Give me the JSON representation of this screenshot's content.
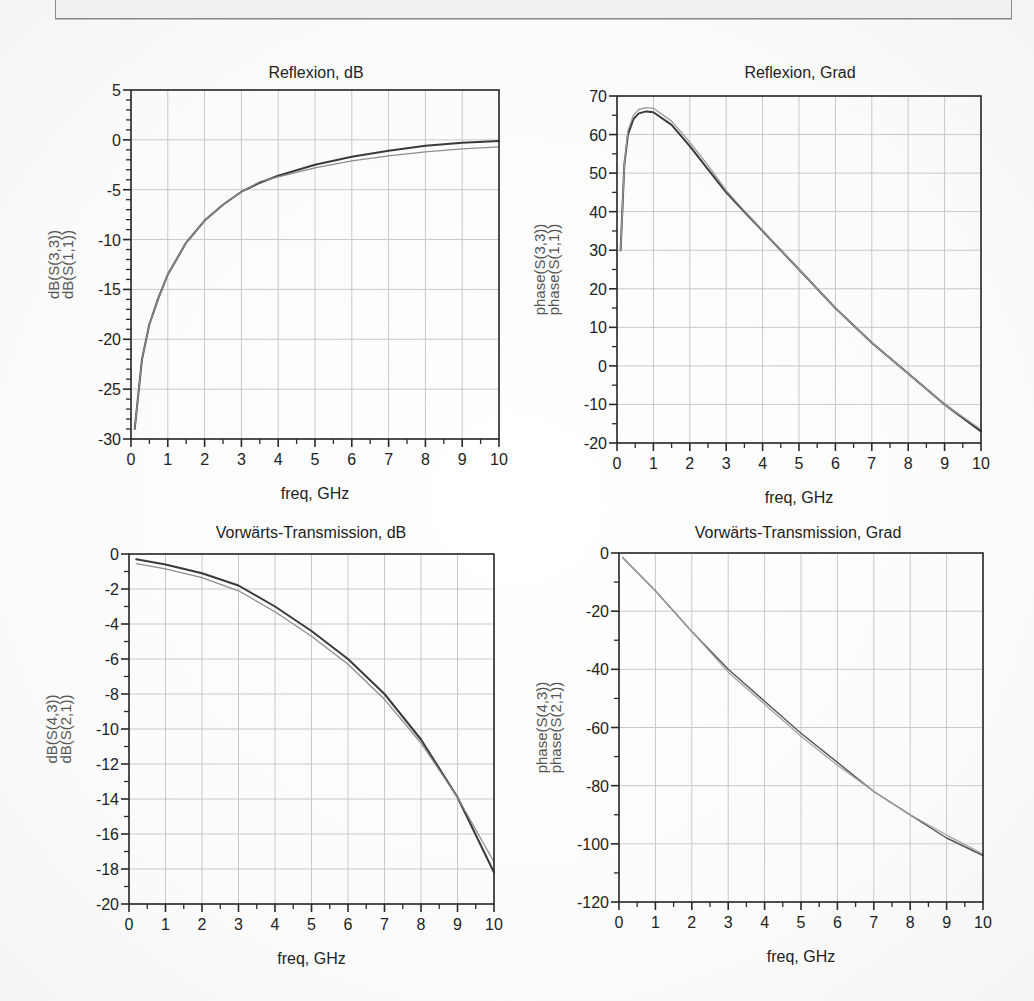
{
  "banner": {
    "text": ""
  },
  "chart_data": [
    {
      "id": "reflexion-db",
      "type": "line",
      "title": "Reflexion, dB",
      "xlabel": "freq, GHz",
      "ylabel_lines": [
        "dB(S(3,3))",
        "dB(S(1,1))"
      ],
      "xlim": [
        0,
        10
      ],
      "ylim": [
        -30,
        5
      ],
      "xticks": [
        0,
        1,
        2,
        3,
        4,
        5,
        6,
        7,
        8,
        9,
        10
      ],
      "yticks": [
        5,
        0,
        -5,
        -10,
        -15,
        -20,
        -25,
        -30
      ],
      "ytick_labels": [
        "5",
        "0",
        "-5",
        "-10",
        "-15",
        "-20",
        "-25",
        "-30"
      ],
      "minor_y_per_major": 5,
      "grid": true,
      "frame": {
        "x0": 131,
        "y0": 90,
        "x1": 499,
        "y1": 439
      },
      "title_pos": [
        316,
        78
      ],
      "series": [
        {
          "name": "dB(S(3,3))",
          "color": "#3a3a3a",
          "width": 2.0,
          "x": [
            0.1,
            0.3,
            0.5,
            0.75,
            1,
            1.5,
            2,
            2.5,
            3,
            3.5,
            4,
            5,
            6,
            7,
            8,
            9,
            10
          ],
          "values": [
            -29,
            -22,
            -18.5,
            -15.8,
            -13.5,
            -10.3,
            -8.1,
            -6.5,
            -5.2,
            -4.3,
            -3.6,
            -2.5,
            -1.7,
            -1.1,
            -0.6,
            -0.3,
            -0.1
          ]
        },
        {
          "name": "dB(S(1,1))",
          "color": "#8c8c8c",
          "width": 1.3,
          "x": [
            0.1,
            0.3,
            0.5,
            0.75,
            1,
            1.5,
            2,
            2.5,
            3,
            3.5,
            4,
            5,
            6,
            7,
            8,
            9,
            10
          ],
          "values": [
            -29,
            -22,
            -18.5,
            -15.8,
            -13.5,
            -10.3,
            -8.1,
            -6.5,
            -5.2,
            -4.2,
            -3.7,
            -2.8,
            -2.1,
            -1.6,
            -1.2,
            -0.9,
            -0.7
          ]
        }
      ]
    },
    {
      "id": "reflexion-grad",
      "type": "line",
      "title": "Reflexion, Grad",
      "xlabel": "freq, GHz",
      "ylabel_lines": [
        "phase(S(3,3))",
        "phase(S(1,1))"
      ],
      "xlim": [
        0,
        10
      ],
      "ylim": [
        -20,
        70
      ],
      "xticks": [
        0,
        1,
        2,
        3,
        4,
        5,
        6,
        7,
        8,
        9,
        10
      ],
      "yticks": [
        70,
        60,
        50,
        40,
        30,
        20,
        10,
        0,
        -10,
        -20
      ],
      "ytick_labels": [
        "70",
        "60",
        "50",
        "40",
        "30",
        "20",
        "10",
        "0",
        "-10",
        "-20"
      ],
      "minor_y_per_major": 2,
      "grid": true,
      "frame": {
        "x0": 617,
        "y0": 96,
        "x1": 981,
        "y1": 443
      },
      "title_pos": [
        800,
        78
      ],
      "series": [
        {
          "name": "phase(S(3,3))",
          "color": "#3a3a3a",
          "width": 2.0,
          "x": [
            0.1,
            0.2,
            0.3,
            0.45,
            0.6,
            0.8,
            1,
            1.5,
            2,
            2.5,
            3,
            3.5,
            4,
            5,
            6,
            7,
            8,
            9,
            10
          ],
          "values": [
            30,
            52,
            60,
            64,
            65.5,
            66,
            65.8,
            62.5,
            57,
            51,
            45,
            40,
            35,
            25,
            15,
            6,
            -2,
            -10,
            -17
          ]
        },
        {
          "name": "phase(S(1,1))",
          "color": "#9a9a9a",
          "width": 1.3,
          "x": [
            0.1,
            0.2,
            0.3,
            0.45,
            0.6,
            0.8,
            1,
            1.5,
            2,
            2.5,
            3,
            3.5,
            4,
            5,
            6,
            7,
            8,
            9,
            10
          ],
          "values": [
            30,
            52,
            61,
            65,
            66.5,
            67,
            66.8,
            63.5,
            58,
            52,
            45.5,
            40.2,
            35.2,
            25,
            15,
            6,
            -2,
            -10,
            -16.5
          ]
        }
      ]
    },
    {
      "id": "transmission-db",
      "type": "line",
      "title": "Vorwärts-Transmission, dB",
      "xlabel": "freq, GHz",
      "ylabel_lines": [
        "dB(S(4,3))",
        "dB(S(2,1))"
      ],
      "xlim": [
        0,
        10
      ],
      "ylim": [
        -20,
        0
      ],
      "xticks": [
        0,
        1,
        2,
        3,
        4,
        5,
        6,
        7,
        8,
        9,
        10
      ],
      "yticks": [
        0,
        -2,
        -4,
        -6,
        -8,
        -10,
        -12,
        -14,
        -16,
        -18,
        -20
      ],
      "ytick_labels": [
        "0",
        "-2",
        "-4",
        "-6",
        "-8",
        "-10",
        "-12",
        "-14",
        "-16",
        "-18",
        "-20"
      ],
      "minor_y_per_major": 2,
      "grid": true,
      "frame": {
        "x0": 129,
        "y0": 554,
        "x1": 494,
        "y1": 904
      },
      "title_pos": [
        311,
        538
      ],
      "series": [
        {
          "name": "dB(S(4,3))",
          "color": "#3a3a3a",
          "width": 2.0,
          "x": [
            0.2,
            1,
            2,
            3,
            4,
            5,
            6,
            7,
            8,
            9,
            10
          ],
          "values": [
            -0.3,
            -0.6,
            -1.1,
            -1.8,
            -3.0,
            -4.4,
            -6.0,
            -8.0,
            -10.6,
            -13.9,
            -18.2
          ]
        },
        {
          "name": "dB(S(2,1))",
          "color": "#8c8c8c",
          "width": 1.3,
          "x": [
            0.2,
            1,
            2,
            3,
            4,
            5,
            6,
            7,
            8,
            9,
            10
          ],
          "values": [
            -0.55,
            -0.85,
            -1.35,
            -2.1,
            -3.3,
            -4.7,
            -6.3,
            -8.3,
            -10.8,
            -13.9,
            -17.6
          ]
        }
      ]
    },
    {
      "id": "transmission-grad",
      "type": "line",
      "title": "Vorwärts-Transmission, Grad",
      "xlabel": "freq, GHz",
      "ylabel_lines": [
        "phase(S(4,3))",
        "phase(S(2,1))"
      ],
      "xlim": [
        0,
        10
      ],
      "ylim": [
        -120,
        0
      ],
      "xticks": [
        0,
        1,
        2,
        3,
        4,
        5,
        6,
        7,
        8,
        9,
        10
      ],
      "yticks": [
        0,
        -20,
        -40,
        -60,
        -80,
        -100,
        -120
      ],
      "ytick_labels": [
        "0",
        "-20",
        "-40",
        "-60",
        "-80",
        "-100",
        "-120"
      ],
      "minor_y_per_major": 2,
      "grid": true,
      "frame": {
        "x0": 619,
        "y0": 553,
        "x1": 983,
        "y1": 902
      },
      "title_pos": [
        798,
        538
      ],
      "series": [
        {
          "name": "phase(S(4,3))",
          "color": "#555555",
          "width": 1.4,
          "x": [
            0.1,
            1,
            2,
            3,
            4,
            5,
            6,
            7,
            8,
            9,
            10
          ],
          "values": [
            -1.5,
            -13,
            -27,
            -40,
            -51,
            -62,
            -72,
            -82,
            -90,
            -98,
            -104
          ]
        },
        {
          "name": "phase(S(2,1))",
          "color": "#a0a0a0",
          "width": 1.2,
          "x": [
            0.1,
            1,
            2,
            3,
            4,
            5,
            6,
            7,
            8,
            9,
            10
          ],
          "values": [
            -1.5,
            -13,
            -27,
            -41,
            -52,
            -63,
            -73,
            -82,
            -90,
            -97,
            -103.5
          ]
        }
      ]
    }
  ]
}
